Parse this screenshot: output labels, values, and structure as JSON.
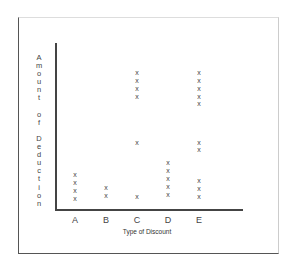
{
  "chart_data": {
    "type": "scatter",
    "subtype": "dot_plot_x_marks",
    "title": "",
    "xlabel": "Type of Discount",
    "ylabel": "Amount of Deduction",
    "categories": [
      "A",
      "B",
      "C",
      "D",
      "E"
    ],
    "marker": "x",
    "grid": false,
    "legend": null,
    "y_ticks": [],
    "note": "No numeric y-axis scale; values are relative vertical positions (0 = axis baseline, 100 = top of axis).",
    "series": [
      {
        "category": "A",
        "x_px": 75,
        "points_y_px": [
          174,
          182,
          190,
          198
        ]
      },
      {
        "category": "B",
        "x_px": 106,
        "points_y_px": [
          187,
          195
        ]
      },
      {
        "category": "C",
        "x_px": 137,
        "points_y_px": [
          72,
          80,
          88,
          96,
          142,
          196
        ]
      },
      {
        "category": "D",
        "x_px": 168,
        "points_y_px": [
          162,
          170,
          178,
          186,
          194
        ]
      },
      {
        "category": "E",
        "x_px": 199,
        "points_y_px": [
          72,
          80,
          88,
          96,
          103,
          142,
          149,
          180,
          188,
          196
        ]
      }
    ],
    "relative_values": {
      "A": [
        7,
        11,
        16,
        21
      ],
      "B": [
        9,
        13
      ],
      "C": [
        7,
        68,
        76,
        81,
        86,
        90
      ],
      "D": [
        9,
        14,
        19,
        24,
        28
      ],
      "E": [
        7,
        12,
        17,
        36,
        40,
        64,
        68,
        76,
        81,
        86,
        90
      ]
    },
    "counts": {
      "A": 4,
      "B": 2,
      "C": 6,
      "D": 5,
      "E": 10
    }
  },
  "labels": {
    "ylabel_vertical": "A\nm\no\nu\nn\nt\n \no\nf\n \nD\ne\nd\nu\nc\nt\ni\no\nn",
    "xlabel": "Type of Discount",
    "marker_glyph": "x"
  }
}
